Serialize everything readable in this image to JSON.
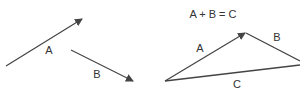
{
  "title": "A + B = C",
  "left": {
    "vector_a_label": "A",
    "vector_b_label": "B"
  },
  "right": {
    "vector_a_label": "A",
    "vector_b_label": "B",
    "vector_c_label": "C"
  },
  "colors": {
    "stroke": "#444444",
    "text": "#333333"
  }
}
